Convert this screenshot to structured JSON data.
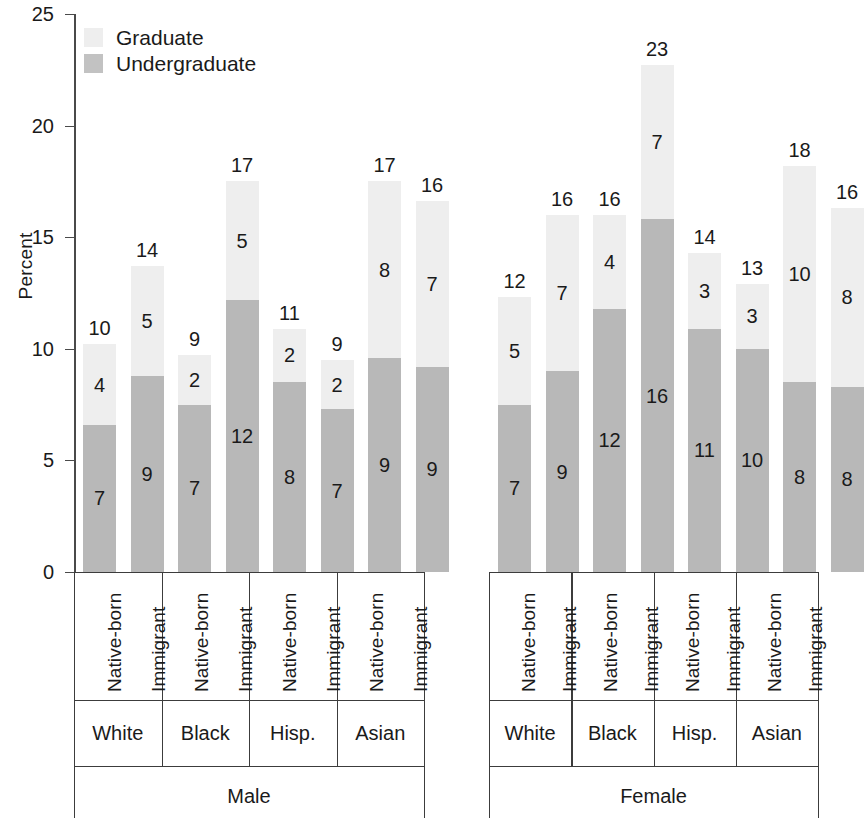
{
  "chart_data": {
    "type": "bar",
    "subtype": "stacked-bar-grouped",
    "title": "",
    "xlabel": "",
    "ylabel": "Percent",
    "ylim": [
      0,
      25
    ],
    "yticks": [
      0,
      5,
      10,
      15,
      20,
      25
    ],
    "grid": false,
    "legend": {
      "position": "top-left",
      "entries": [
        {
          "name": "Graduate",
          "color": "#eeeeee"
        },
        {
          "name": "Undergraduate",
          "color": "#c2c2c2"
        }
      ]
    },
    "group_labels": [
      "Male",
      "Female"
    ],
    "categories": [
      "White",
      "Black",
      "Hisp.",
      "Asian"
    ],
    "subcategories": [
      "Native-born",
      "Immigrant"
    ],
    "series": [
      {
        "name": "Undergraduate",
        "color": "#b8b8b8"
      },
      {
        "name": "Graduate",
        "color": "#eeeeee"
      }
    ],
    "bars": [
      {
        "sex": "Male",
        "race": "White",
        "origin": "Native-born",
        "undergraduate": 7,
        "graduate": 4,
        "total": 10,
        "undergraduate_height": 6.6,
        "graduate_height": 3.6
      },
      {
        "sex": "Male",
        "race": "White",
        "origin": "Immigrant",
        "undergraduate": 9,
        "graduate": 5,
        "total": 14,
        "undergraduate_height": 8.8,
        "graduate_height": 4.9
      },
      {
        "sex": "Male",
        "race": "Black",
        "origin": "Native-born",
        "undergraduate": 7,
        "graduate": 2,
        "total": 9,
        "undergraduate_height": 7.5,
        "graduate_height": 2.2
      },
      {
        "sex": "Male",
        "race": "Black",
        "origin": "Immigrant",
        "undergraduate": 12,
        "graduate": 5,
        "total": 17,
        "undergraduate_height": 12.2,
        "graduate_height": 5.3
      },
      {
        "sex": "Male",
        "race": "Hisp.",
        "origin": "Native-born",
        "undergraduate": 8,
        "graduate": 2,
        "total": 11,
        "undergraduate_height": 8.5,
        "graduate_height": 2.4
      },
      {
        "sex": "Male",
        "race": "Hisp.",
        "origin": "Immigrant",
        "undergraduate": 7,
        "graduate": 2,
        "total": 9,
        "undergraduate_height": 7.3,
        "graduate_height": 2.2
      },
      {
        "sex": "Male",
        "race": "Asian",
        "origin": "Native-born",
        "undergraduate": 9,
        "graduate": 8,
        "total": 17,
        "undergraduate_height": 9.6,
        "graduate_height": 7.9
      },
      {
        "sex": "Male",
        "race": "Asian",
        "origin": "Immigrant",
        "undergraduate": 9,
        "graduate": 7,
        "total": 16,
        "undergraduate_height": 9.2,
        "graduate_height": 7.4
      },
      {
        "sex": "Female",
        "race": "White",
        "origin": "Native-born",
        "undergraduate": 7,
        "graduate": 5,
        "total": 12,
        "undergraduate_height": 7.5,
        "graduate_height": 4.8
      },
      {
        "sex": "Female",
        "race": "White",
        "origin": "Immigrant",
        "undergraduate": 9,
        "graduate": 7,
        "total": 16,
        "undergraduate_height": 9.0,
        "graduate_height": 7.0
      },
      {
        "sex": "Female",
        "race": "Black",
        "origin": "Native-born",
        "undergraduate": 12,
        "graduate": 4,
        "total": 16,
        "undergraduate_height": 11.8,
        "graduate_height": 4.2
      },
      {
        "sex": "Female",
        "race": "Black",
        "origin": "Immigrant",
        "undergraduate": 16,
        "graduate": 7,
        "total": 23,
        "undergraduate_height": 15.8,
        "graduate_height": 6.9
      },
      {
        "sex": "Female",
        "race": "Hisp.",
        "origin": "Native-born",
        "undergraduate": 11,
        "graduate": 3,
        "total": 14,
        "undergraduate_height": 10.9,
        "graduate_height": 3.4
      },
      {
        "sex": "Female",
        "race": "Hisp.",
        "origin": "Immigrant",
        "undergraduate": 10,
        "graduate": 3,
        "total": 13,
        "undergraduate_height": 10.0,
        "graduate_height": 2.9
      },
      {
        "sex": "Female",
        "race": "Asian",
        "origin": "Native-born",
        "undergraduate": 8,
        "graduate": 10,
        "total": 18,
        "undergraduate_height": 8.5,
        "graduate_height": 9.7
      },
      {
        "sex": "Female",
        "race": "Asian",
        "origin": "Immigrant",
        "undergraduate": 8,
        "graduate": 8,
        "total": 16,
        "undergraduate_height": 8.3,
        "graduate_height": 8.0
      }
    ]
  },
  "axis": {
    "y_title": "Percent",
    "y_tick_labels": [
      "25",
      "20",
      "15",
      "10",
      "5",
      "0"
    ]
  },
  "legend": {
    "graduate_label": "Graduate",
    "undergraduate_label": "Undergraduate"
  },
  "colors": {
    "graduate": "#eeeeee",
    "undergraduate": "#b8b8b8",
    "axis": "#4a4a4a",
    "text": "#1a1a1a"
  }
}
